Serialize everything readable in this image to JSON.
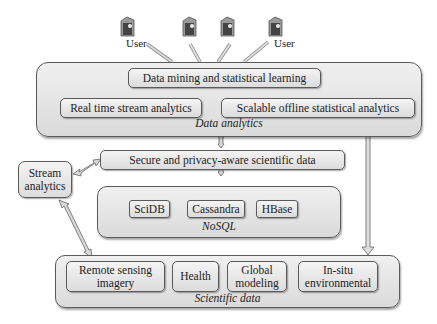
{
  "users": {
    "label": "User",
    "count": 4,
    "labels_visible": [
      "User",
      "User"
    ]
  },
  "data_analytics": {
    "caption": "Data analytics",
    "top": "Data mining and statistical learning",
    "left": "Real time stream analytics",
    "right": "Scalable offline statistical analytics"
  },
  "secure": {
    "label": "Secure and privacy-aware scientific data"
  },
  "stream": {
    "line1": "Stream",
    "line2": "analytics"
  },
  "nosql": {
    "caption": "NoSQL",
    "items": [
      "SciDB",
      "Cassandra",
      "HBase"
    ]
  },
  "scientific_data": {
    "caption": "Scientific data",
    "items": [
      {
        "line1": "Remote sensing",
        "line2": "imagery"
      },
      {
        "line1": "Health",
        "line2": ""
      },
      {
        "line1": "Global",
        "line2": "modeling"
      },
      {
        "line1": "In-situ",
        "line2": "environmental"
      }
    ]
  },
  "colors": {
    "panel_top": "#f0f0f0",
    "panel_bottom": "#dadada",
    "border": "#5a5a5a",
    "arrow_fill": "#d8d8d8"
  }
}
